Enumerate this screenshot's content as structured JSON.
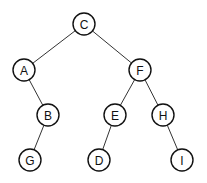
{
  "diagram": {
    "type": "binary-tree",
    "node_radius": 11,
    "nodes": [
      {
        "id": "C",
        "label": "C",
        "x": 84,
        "y": 24
      },
      {
        "id": "A",
        "label": "A",
        "x": 24,
        "y": 70
      },
      {
        "id": "F",
        "label": "F",
        "x": 140,
        "y": 70
      },
      {
        "id": "B",
        "label": "B",
        "x": 48,
        "y": 115
      },
      {
        "id": "E",
        "label": "E",
        "x": 115,
        "y": 115
      },
      {
        "id": "H",
        "label": "H",
        "x": 163,
        "y": 115
      },
      {
        "id": "G",
        "label": "G",
        "x": 30,
        "y": 160
      },
      {
        "id": "D",
        "label": "D",
        "x": 99,
        "y": 160
      },
      {
        "id": "I",
        "label": "I",
        "x": 182,
        "y": 160
      }
    ],
    "edges": [
      {
        "from": "C",
        "to": "A"
      },
      {
        "from": "C",
        "to": "F"
      },
      {
        "from": "A",
        "to": "B"
      },
      {
        "from": "F",
        "to": "E"
      },
      {
        "from": "F",
        "to": "H"
      },
      {
        "from": "B",
        "to": "G"
      },
      {
        "from": "E",
        "to": "D"
      },
      {
        "from": "H",
        "to": "I"
      }
    ]
  }
}
